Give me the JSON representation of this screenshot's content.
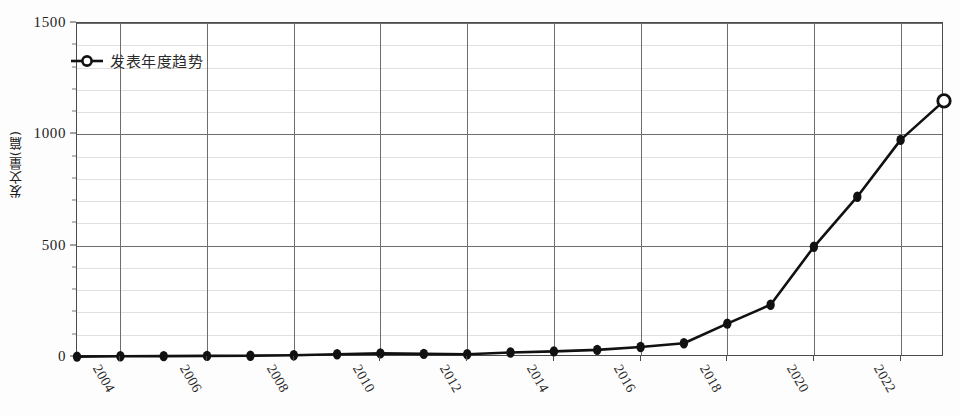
{
  "chart_data": {
    "type": "line",
    "title": "",
    "xlabel": "",
    "ylabel": "发文量(篇)",
    "legend": [
      "发表年度趋势"
    ],
    "legend_position": "top-left",
    "grid": true,
    "xlim": [
      2003,
      2023
    ],
    "ylim": [
      0,
      1500
    ],
    "ytick_values": [
      0,
      500,
      1000,
      1500
    ],
    "ytick_labels": [
      "0",
      "500",
      "1000",
      "1500"
    ],
    "y_minor_step": 100,
    "xtick_values": [
      2004,
      2006,
      2008,
      2010,
      2012,
      2014,
      2016,
      2018,
      2020,
      2022
    ],
    "xtick_labels": [
      "2004",
      "2006",
      "2008",
      "2010",
      "2012",
      "2014",
      "2016",
      "2018",
      "2020",
      "2022"
    ],
    "x": [
      2003,
      2004,
      2005,
      2006,
      2007,
      2008,
      2009,
      2010,
      2011,
      2012,
      2013,
      2014,
      2015,
      2016,
      2017,
      2018,
      2019,
      2020,
      2021,
      2022,
      2023
    ],
    "series": [
      {
        "name": "发表年度趋势",
        "values": [
          2,
          3,
          4,
          5,
          6,
          8,
          12,
          16,
          14,
          12,
          20,
          25,
          32,
          45,
          62,
          150,
          235,
          495,
          720,
          975,
          1150
        ],
        "color": "#111111",
        "marker": "filled-diamond",
        "last_point_marker": "open-circle"
      }
    ]
  },
  "legend": {
    "label": "发表年度趋势"
  },
  "axes": {
    "y_title": "发文量(篇)"
  }
}
